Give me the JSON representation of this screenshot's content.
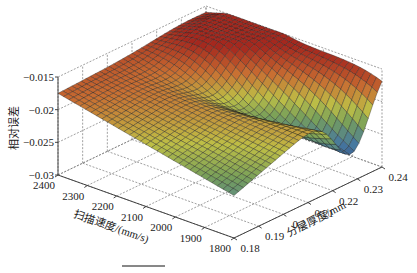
{
  "chart_data": {
    "type": "surface3d",
    "title": "",
    "xlabel": "扫描速度/(mm/s)",
    "ylabel": "分层厚度/mm",
    "zlabel": "相对误差",
    "x_ticks": [
      "2400",
      "2300",
      "2200",
      "2100",
      "2000",
      "1900",
      "1800"
    ],
    "x_values": [
      2400,
      2300,
      2200,
      2100,
      2000,
      1900,
      1800
    ],
    "y_ticks": [
      "0.18",
      "0.19",
      "0.2",
      "0.21",
      "0.22",
      "0.23",
      "0.24"
    ],
    "y_values": [
      0.18,
      0.19,
      0.2,
      0.21,
      0.22,
      0.23,
      0.24
    ],
    "z_ticks": [
      "-0.015",
      "-0.02",
      "-0.025",
      "-0.03"
    ],
    "z_values": [
      -0.015,
      -0.02,
      -0.025,
      -0.03
    ],
    "xlim": [
      1800,
      2400
    ],
    "ylim": [
      0.18,
      0.24
    ],
    "zlim": [
      -0.03,
      -0.015
    ],
    "grid": true,
    "colormap": "jet-like (red high, blue low)",
    "corner_values": {
      "speed_2400_thick_0.18": -0.0175,
      "speed_1800_thick_0.18": -0.0235,
      "speed_2400_thick_0.24": -0.0165,
      "speed_1800_thick_0.24": -0.015
    },
    "features": "Surface peaks near (2400, 0.24) at about -0.0155; a valley runs diagonally toward (1900-1800, 0.22) reaching about -0.027; front edge slopes down from -0.0175 at 2400 to about -0.0235 at 1800."
  },
  "labels": {
    "z_axis": "相对误差",
    "x_axis": "扫描速度/(mm/s)",
    "y_axis": "分层厚度/mm"
  }
}
